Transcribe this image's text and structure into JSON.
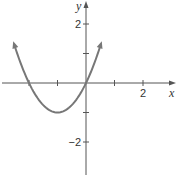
{
  "chart_data": {
    "type": "line",
    "title": "",
    "function": "y = x^2 + 2x",
    "xlabel": "x",
    "ylabel": "y",
    "xlim": [
      -3,
      3
    ],
    "ylim": [
      -3,
      3
    ],
    "x_ticks": [
      -2,
      -1,
      1,
      2
    ],
    "x_tick_labels": [
      {
        "value": 2,
        "label": "2"
      }
    ],
    "y_ticks": [
      -2,
      -1,
      1,
      2
    ],
    "y_tick_labels": [
      {
        "value": 2,
        "label": "2"
      },
      {
        "value": -2,
        "label": "−2"
      }
    ],
    "grid": false,
    "series": [
      {
        "name": "parabola",
        "color": "#777777",
        "x": [
          -2.5,
          -2,
          -1.5,
          -1,
          -0.5,
          0,
          0.5
        ],
        "y": [
          1.25,
          0,
          -0.75,
          -1,
          -0.75,
          0,
          1.25
        ],
        "arrows": "both-ends"
      }
    ],
    "key_points": {
      "vertex": [
        -1,
        -1
      ],
      "x_intercepts": [
        -2,
        0
      ]
    }
  }
}
